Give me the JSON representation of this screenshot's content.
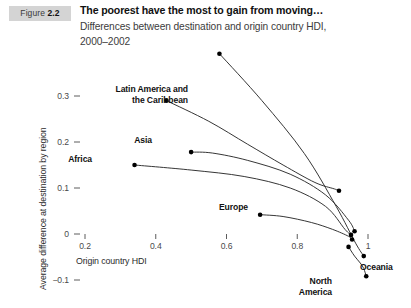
{
  "figure": {
    "badge_word": "Figure",
    "badge_number": "2.2",
    "title": "The poorest have the most to gain from moving…",
    "subtitle_line1": "Differences between destination and origin country HDI,",
    "subtitle_line2": "2000–2002"
  },
  "chart_data": {
    "type": "line",
    "title": "The poorest have the most to gain from moving…",
    "subtitle": "Differences between destination and origin country HDI, 2000–2002",
    "xlabel": "Origin country HDI",
    "ylabel": "Average difference at destination by region",
    "xlim": [
      0.15,
      1.03
    ],
    "ylim": [
      -0.12,
      0.33
    ],
    "xticks": [
      "0.2",
      "0.4",
      "0.6",
      "0.8",
      "1"
    ],
    "xtick_values": [
      0.2,
      0.4,
      0.6,
      0.8,
      1.0
    ],
    "yticks": [
      "0.3",
      "0.2",
      "0.1",
      "0",
      "−0.1"
    ],
    "ytick_values": [
      0.3,
      0.2,
      0.1,
      0.0,
      -0.1
    ],
    "grid": false,
    "legend": "inline-endpoint-labels",
    "series": [
      {
        "name": "Africa",
        "label_pos": "left",
        "points": [
          {
            "x": 0.34,
            "y": 0.15
          },
          {
            "x": 0.5,
            "y": 0.139
          },
          {
            "x": 0.65,
            "y": 0.125
          },
          {
            "x": 0.78,
            "y": 0.1
          },
          {
            "x": 0.88,
            "y": 0.06
          },
          {
            "x": 0.935,
            "y": 0.01
          },
          {
            "x": 0.952,
            "y": -0.002
          }
        ]
      },
      {
        "name": "Asia",
        "label_pos": "left",
        "points": [
          {
            "x": 0.5,
            "y": 0.178
          },
          {
            "x": 0.56,
            "y": 0.176
          },
          {
            "x": 0.66,
            "y": 0.16
          },
          {
            "x": 0.78,
            "y": 0.13
          },
          {
            "x": 0.88,
            "y": 0.085
          },
          {
            "x": 0.945,
            "y": 0.03
          },
          {
            "x": 0.962,
            "y": 0.006
          }
        ]
      },
      {
        "name": "Latin America and\nthe Caribbean",
        "label_pos": "left",
        "points": [
          {
            "x": 0.43,
            "y": 0.29
          },
          {
            "x": 0.55,
            "y": 0.245
          },
          {
            "x": 0.66,
            "y": 0.195
          },
          {
            "x": 0.76,
            "y": 0.15
          },
          {
            "x": 0.85,
            "y": 0.112
          },
          {
            "x": 0.905,
            "y": 0.098
          },
          {
            "x": 0.918,
            "y": 0.094
          }
        ]
      },
      {
        "name": "Europe",
        "label_pos": "left",
        "points": [
          {
            "x": 0.695,
            "y": 0.042
          },
          {
            "x": 0.76,
            "y": 0.038
          },
          {
            "x": 0.84,
            "y": 0.025
          },
          {
            "x": 0.9,
            "y": 0.01
          },
          {
            "x": 0.945,
            "y": -0.005
          },
          {
            "x": 0.955,
            "y": -0.012
          }
        ]
      },
      {
        "name": "Oceania",
        "label_pos": "right",
        "points": [
          {
            "x": 0.58,
            "y": 0.392
          },
          {
            "x": 0.7,
            "y": 0.29
          },
          {
            "x": 0.82,
            "y": 0.175
          },
          {
            "x": 0.91,
            "y": 0.06
          },
          {
            "x": 0.965,
            "y": -0.02
          },
          {
            "x": 0.988,
            "y": -0.048
          }
        ]
      },
      {
        "name": "North\nAmerica",
        "label_pos": "left",
        "points": [
          {
            "x": 0.945,
            "y": -0.028
          },
          {
            "x": 0.962,
            "y": -0.048
          },
          {
            "x": 0.978,
            "y": -0.063
          },
          {
            "x": 0.988,
            "y": -0.075
          },
          {
            "x": 0.995,
            "y": -0.092
          }
        ]
      }
    ]
  },
  "axis_text": {
    "x_title": "Origin country HDI",
    "y_title": "Average difference at destination by region"
  },
  "series_labels": {
    "africa": "Africa",
    "asia": "Asia",
    "latin_america_l1": "Latin America and",
    "latin_america_l2": "the Caribbean",
    "europe": "Europe",
    "oceania": "Oceania",
    "north_america_l1": "North",
    "north_america_l2": "America"
  },
  "colors": {
    "line": "#2b2b2b",
    "marker": "#000000",
    "badge_bg": "#d4d4d4",
    "text": "#111111",
    "tick": "#4a4a4a",
    "background": "#ffffff"
  }
}
